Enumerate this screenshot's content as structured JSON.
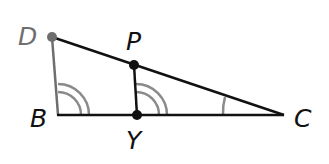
{
  "diagram": {
    "type": "geometry",
    "points": {
      "D": {
        "label": "D",
        "x": 52,
        "y": 37,
        "color": "#6e6e6e"
      },
      "B": {
        "label": "B",
        "x": 58,
        "y": 115
      },
      "P": {
        "label": "P",
        "x": 134,
        "y": 65
      },
      "Y": {
        "label": "Y",
        "x": 137,
        "y": 115
      },
      "C": {
        "label": "C",
        "x": 284,
        "y": 115
      }
    },
    "segments": [
      {
        "from": "D",
        "to": "B",
        "color": "#6e6e6e"
      },
      {
        "from": "D",
        "to": "C",
        "color": "#111111"
      },
      {
        "from": "B",
        "to": "C",
        "color": "#111111"
      },
      {
        "from": "P",
        "to": "Y",
        "color": "#111111"
      }
    ],
    "angle_marks": [
      {
        "vertex": "B",
        "arcs": 2,
        "color": "#8a8a8a"
      },
      {
        "vertex": "Y",
        "arcs": 2,
        "color": "#8a8a8a"
      },
      {
        "vertex": "C",
        "arcs": 1,
        "color": "#8a8a8a"
      }
    ],
    "labels": {
      "D": "D",
      "P": "P",
      "B": "B",
      "Y": "Y",
      "C": "C"
    }
  }
}
